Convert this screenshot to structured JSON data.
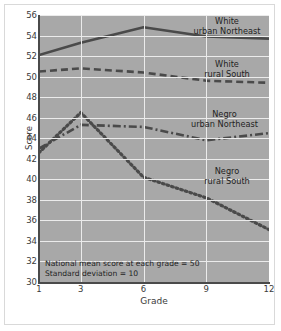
{
  "chart_data": {
    "type": "line",
    "title": "",
    "xlabel": "Grade",
    "ylabel": "Score",
    "x": [
      1,
      3,
      6,
      9,
      12
    ],
    "xticks": [
      "1",
      "3",
      "6",
      "9",
      "12"
    ],
    "yticks": [
      "30",
      "32",
      "34",
      "36",
      "38",
      "40",
      "42",
      "44",
      "46",
      "48",
      "50",
      "52",
      "54",
      "56"
    ],
    "xlim": [
      1,
      12
    ],
    "ylim": [
      30,
      56
    ],
    "grid": true,
    "legend_position": "inline-right",
    "plot_background": "#a8a8a8",
    "gridline_color": "#ebebeb",
    "line_color": "#4a4a4a",
    "series": [
      {
        "name": "White urban Northeast",
        "label_line1": "White",
        "label_line2": "urban Northeast",
        "style": "solid",
        "values": [
          52.1,
          53.3,
          54.8,
          53.9,
          53.7
        ]
      },
      {
        "name": "White rural South",
        "label_line1": "White",
        "label_line2": "rural South",
        "style": "dashed",
        "values": [
          50.5,
          50.8,
          50.4,
          49.6,
          49.4
        ]
      },
      {
        "name": "Negro urban Northeast",
        "label_line1": "Negro",
        "label_line2": "urban Northeast",
        "style": "dash-dot",
        "values": [
          43.0,
          45.3,
          45.1,
          43.8,
          44.5
        ]
      },
      {
        "name": "Negro rural South",
        "label_line1": "Negro",
        "label_line2": "rural South",
        "style": "dotted",
        "values": [
          42.6,
          46.5,
          40.2,
          38.2,
          35.1
        ]
      }
    ],
    "annotations": [
      "National mean score at each grade = 50",
      "Standard deviation = 10"
    ]
  }
}
